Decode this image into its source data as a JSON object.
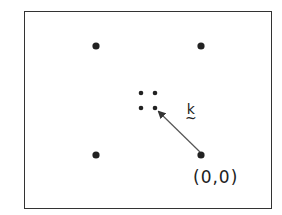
{
  "diagram": {
    "type": "reciprocal-lattice-sketch",
    "frame": {
      "x": 24,
      "y": 11,
      "width": 248,
      "height": 198
    },
    "lattice_points": [
      {
        "x": 96,
        "y": 46,
        "r": 3.6
      },
      {
        "x": 201,
        "y": 46,
        "r": 3.6
      },
      {
        "x": 96,
        "y": 155,
        "r": 3.6
      },
      {
        "x": 201,
        "y": 155,
        "r": 3.6
      }
    ],
    "small_points": [
      {
        "x": 141,
        "y": 93,
        "r": 2.3
      },
      {
        "x": 155,
        "y": 93,
        "r": 2.3
      },
      {
        "x": 141,
        "y": 108,
        "r": 2.3
      },
      {
        "x": 155,
        "y": 108,
        "r": 2.3
      }
    ],
    "vector": {
      "from": [
        200,
        152
      ],
      "to": [
        159,
        112
      ],
      "label": "k",
      "label_decoration": "~"
    },
    "origin_label": "(0,0)",
    "colors": {
      "ink": "#222222",
      "frame": "#333333",
      "arrow": "#555555"
    }
  }
}
